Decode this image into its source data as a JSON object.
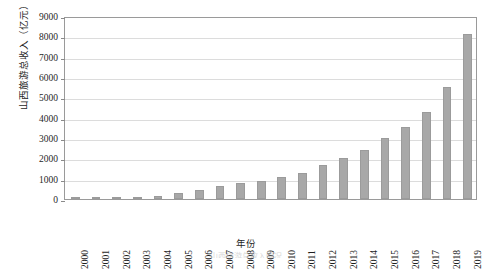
{
  "chart_data": {
    "type": "bar",
    "title": "",
    "xlabel": "年份",
    "ylabel": "山西旅游总收入（亿元）",
    "ylim": [
      0,
      9000
    ],
    "ytick_step": 1000,
    "grid": true,
    "legend": "none",
    "bar_color": "#a8a8a8",
    "categories": [
      "2000",
      "2001",
      "2002",
      "2003",
      "2004",
      "2005",
      "2006",
      "2007",
      "2008",
      "2009",
      "2010",
      "2011",
      "2012",
      "2013",
      "2014",
      "2015",
      "2016",
      "2017",
      "2018",
      "2019"
    ],
    "values": [
      55,
      70,
      95,
      71,
      160,
      290,
      440,
      620,
      780,
      892,
      1070,
      1270,
      1650,
      2000,
      2430,
      2990,
      3540,
      4300,
      5500,
      8100
    ],
    "yticks": [
      "0",
      "1000",
      "2000",
      "3000",
      "4000",
      "5000",
      "6000",
      "7000",
      "8000",
      "9000"
    ],
    "ytick_values": [
      0,
      1000,
      2000,
      3000,
      4000,
      5000,
      6000,
      7000,
      8000,
      9000
    ]
  },
  "figure": {
    "caption": "山西旅游总收入情况",
    "axis_color": "#9a9a9a",
    "grid_color": "#dcdcdc"
  }
}
